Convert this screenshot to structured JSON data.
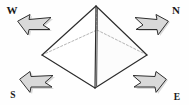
{
  "figure": {
    "background_color": "#fefefe",
    "line_color": "#2b2b2b",
    "hidden_line_color": "#8d8d8d",
    "arrow_fill_color": "#d9d9d9",
    "arrow_outline_color": "#2f2f2f",
    "label_color": "#1a1a1a"
  },
  "shape": {
    "name": "square pyramid",
    "apex": {
      "x": 96,
      "y": 6
    },
    "base_vertices": [
      {
        "name": "left",
        "x": 42,
        "y": 55
      },
      {
        "name": "front",
        "x": 95,
        "y": 88
      },
      {
        "name": "right",
        "x": 147,
        "y": 55
      },
      {
        "name": "back",
        "x": 97,
        "y": 30
      }
    ],
    "visible_faces": 2,
    "hidden_edges": 3
  },
  "labels": [
    {
      "id": "west",
      "text": "W",
      "x": 12,
      "y": 14,
      "corner": "top-left"
    },
    {
      "id": "north",
      "text": "N",
      "x": 176,
      "y": 14,
      "corner": "top-right"
    },
    {
      "id": "south",
      "text": "S",
      "x": 13,
      "y": 98,
      "corner": "bottom-left"
    },
    {
      "id": "east",
      "text": "E",
      "x": 177,
      "y": 100,
      "corner": "bottom-right"
    }
  ],
  "arrows": [
    {
      "id": "arrow-west",
      "label": "W",
      "points_toward": "lower-right",
      "corner": "top-left"
    },
    {
      "id": "arrow-north",
      "label": "N",
      "points_toward": "lower-left",
      "corner": "top-right"
    },
    {
      "id": "arrow-south",
      "label": "S",
      "points_toward": "upper-right",
      "corner": "bottom-left"
    },
    {
      "id": "arrow-east",
      "label": "E",
      "points_toward": "upper-left",
      "corner": "bottom-right"
    }
  ]
}
